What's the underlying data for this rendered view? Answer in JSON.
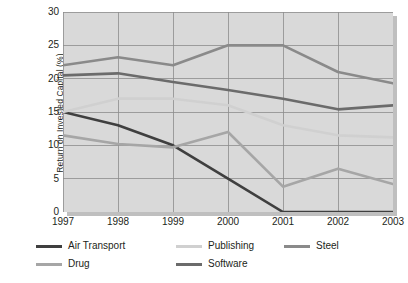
{
  "chart_data": {
    "type": "line",
    "title": "",
    "subtitle": "",
    "xlabel": "",
    "ylabel": "Return on Invested Capital (%)",
    "x": [
      "1997",
      "1998",
      "1999",
      "2000",
      "2001",
      "2002",
      "2003"
    ],
    "categories": [
      "1997",
      "1998",
      "1999",
      "2000",
      "2001",
      "2002",
      "2003"
    ],
    "xlim": [
      0,
      6
    ],
    "ylim": [
      0,
      30
    ],
    "yticks": [
      0,
      5,
      10,
      15,
      20,
      25,
      30
    ],
    "ytick_labels": [
      "0",
      "5",
      "10",
      "15",
      "20",
      "25",
      "30"
    ],
    "grid": true,
    "grid_color": "#8c8c8c",
    "plot_background": "#d9d9d9",
    "legend_position": "bottom",
    "series": [
      {
        "name": "Air Transport",
        "color": "#3f3f3f",
        "values": [
          15.0,
          13.0,
          10.0,
          5.0,
          0.0,
          0.0,
          0.0
        ]
      },
      {
        "name": "Drug",
        "color": "#a6a6a6",
        "values": [
          11.5,
          10.2,
          9.7,
          12.0,
          3.8,
          6.5,
          4.2
        ]
      },
      {
        "name": "Publishing",
        "color": "#d0d0d0",
        "values": [
          15.0,
          17.0,
          17.0,
          16.0,
          13.0,
          11.5,
          11.2
        ]
      },
      {
        "name": "Software",
        "color": "#6b6b6b",
        "values": [
          20.5,
          20.8,
          19.5,
          18.3,
          17.0,
          15.4,
          16.0
        ]
      },
      {
        "name": "Steel",
        "color": "#8a8a8a",
        "values": [
          22.0,
          23.2,
          22.0,
          25.0,
          25.0,
          21.0,
          19.3
        ]
      }
    ]
  },
  "legend": {
    "items": [
      {
        "label": "Air Transport",
        "color": "#3f3f3f"
      },
      {
        "label": "Publishing",
        "color": "#d0d0d0"
      },
      {
        "label": "Steel",
        "color": "#8a8a8a"
      },
      {
        "label": "Drug",
        "color": "#a6a6a6"
      },
      {
        "label": "Software",
        "color": "#6b6b6b"
      }
    ]
  }
}
